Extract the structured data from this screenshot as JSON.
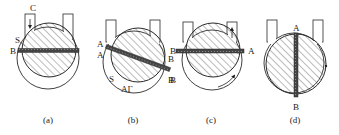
{
  "figure": {
    "panels": [
      {
        "id": "a",
        "caption": "(a)",
        "labels": {
          "top": "C",
          "seal": "S",
          "left": "B"
        },
        "blade_orientation": "horizontal",
        "arrow": "down-in-left-port"
      },
      {
        "id": "b",
        "caption": "(b)",
        "labels": {
          "left_upper": "A",
          "left_lower": "A",
          "right_upper": "B",
          "right_lower": "B",
          "seal": "S",
          "bottom": "AΓ"
        },
        "blade_orientation": "tilted",
        "arrow": "none"
      },
      {
        "id": "c",
        "caption": "(c)",
        "labels": {
          "left": "B",
          "left_lower": "B",
          "right": "A"
        },
        "blade_orientation": "horizontal",
        "arrow": "up-in-right-port"
      },
      {
        "id": "d",
        "caption": "(d)",
        "labels": {
          "top": "A",
          "bottom": "B",
          "left": "A"
        },
        "blade_orientation": "vertical",
        "arrow": "up-on-right-rim"
      }
    ]
  },
  "colors": {
    "stroke": "#2a2a2a",
    "hatch": "#555555",
    "blade": "#3a3a3a",
    "background": "#ffffff"
  }
}
